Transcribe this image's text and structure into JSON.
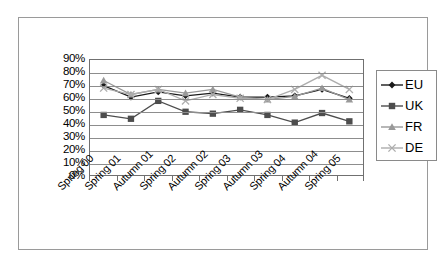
{
  "chart_data": {
    "type": "line",
    "title": "",
    "xlabel": "",
    "ylabel": "",
    "ylim": [
      0,
      90
    ],
    "ytick_step": 10,
    "ytick_labels": [
      "90%",
      "80%",
      "70%",
      "60%",
      "50%",
      "40%",
      "30%",
      "20%",
      "10%",
      "0%"
    ],
    "grid": true,
    "legend_position": "right",
    "categories": [
      "Spring 00",
      "Spring 01",
      "Autumn 01",
      "Spring 02",
      "Autumn 02",
      "Spring 03",
      "Autumn 03",
      "Spring 04",
      "Autumn 04",
      "Spring 05"
    ],
    "series": [
      {
        "name": "EU",
        "color": "#1a1a1a",
        "marker": "diamond",
        "values": [
          70,
          61,
          65,
          62,
          64,
          61,
          61,
          62,
          67,
          60
        ]
      },
      {
        "name": "UK",
        "color": "#4d4d4d",
        "marker": "square",
        "values": [
          47,
          44,
          58,
          49.5,
          48,
          51,
          47,
          41,
          48.5,
          42
        ]
      },
      {
        "name": "FR",
        "color": "#999999",
        "marker": "triangle",
        "values": [
          74,
          63,
          67,
          64,
          67,
          61,
          59,
          61.5,
          68,
          59
        ]
      },
      {
        "name": "DE",
        "color": "#adadad",
        "marker": "cross",
        "values": [
          68,
          63,
          67,
          58,
          63,
          60,
          59,
          67,
          78,
          67
        ]
      }
    ]
  },
  "legend": {
    "items": [
      {
        "label": "EU"
      },
      {
        "label": "UK"
      },
      {
        "label": "FR"
      },
      {
        "label": "DE"
      }
    ]
  },
  "colors": {
    "frame_border": "#9a9a9a",
    "plot_border": "#707070",
    "gridline": "#8d8d8d",
    "background": "#ffffff",
    "text": "#000000"
  }
}
